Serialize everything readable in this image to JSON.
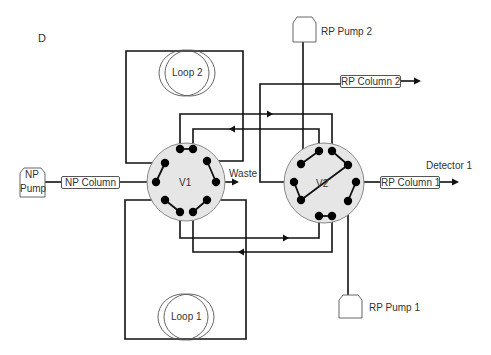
{
  "panel_label": "D",
  "valves": {
    "v1": {
      "label": "V1",
      "fill": "#e6e6e6"
    },
    "v2": {
      "label": "V2",
      "fill": "#e6e6e6"
    }
  },
  "loops": {
    "loop1": {
      "label": "Loop 1"
    },
    "loop2": {
      "label": "Loop 2"
    }
  },
  "pumps": {
    "np_pump": {
      "line1": "NP",
      "line2": "Pump"
    },
    "rp_pump_1": {
      "label": "RP Pump 1"
    },
    "rp_pump_2": {
      "label": "RP Pump 2"
    }
  },
  "columns": {
    "np_column": {
      "label": "NP Column"
    },
    "rp_column_1": {
      "label": "RP Column 1"
    },
    "rp_column_2": {
      "label": "RP Column 2"
    }
  },
  "outputs": {
    "waste": {
      "label": "Waste"
    },
    "detector_1": {
      "label": "Detector 1"
    }
  },
  "colors": {
    "line": "#111111",
    "valve_fill": "#e6e6e6",
    "valve_stroke": "#888888",
    "port": "#000000"
  }
}
